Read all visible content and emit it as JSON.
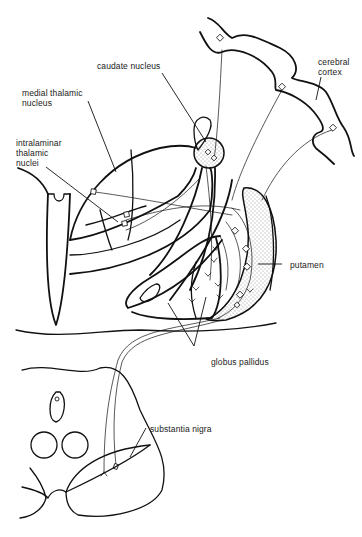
{
  "diagram": {
    "type": "anatomical line drawing",
    "labels": {
      "caudate_nucleus": "caudate nucleus",
      "medial_thalamic_nucleus": "medial thalamic\nnucleus",
      "intralaminar_thalamic_nuclei": "intralaminar\nthalamic\nnuclei",
      "cerebral_cortex": "cerebral\ncortex",
      "putamen": "putamen",
      "globus_pallidus": "globus pallidus",
      "substantia_nigra": "substantia nigra"
    },
    "colors": {
      "line": "#111111",
      "background": "#ffffff",
      "stipple": "#333333"
    }
  }
}
